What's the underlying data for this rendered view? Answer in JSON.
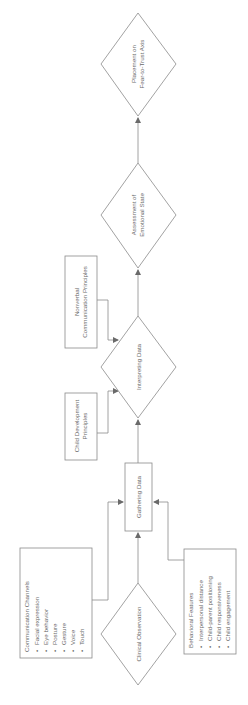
{
  "diagram": {
    "orientation": "rotated-90-ccw",
    "nodes": {
      "clinical_observation": {
        "label": "Clinical Observation",
        "shape": "diamond"
      },
      "gathering_data": {
        "label": "Gathering Data",
        "shape": "rectangle"
      },
      "interpreting_data": {
        "label": "Interpreting Data",
        "shape": "diamond"
      },
      "assessment": {
        "line1": "Assessment of",
        "line2": "Emotional State",
        "shape": "diamond"
      },
      "placement": {
        "line1": "Placement on",
        "line2": "Fear-to-Trust Axis",
        "shape": "diamond"
      },
      "child_development": {
        "line1": "Child Development",
        "line2": "Principles",
        "shape": "rectangle"
      },
      "nonverbal": {
        "line1": "Nonverbal",
        "line2": "Communication Principles",
        "shape": "rectangle"
      },
      "communication_channels": {
        "title": "Communication Channels",
        "items": [
          "Facial expression",
          "Eye behavior",
          "Posture",
          "Gesture",
          "Voice",
          "Touch"
        ]
      },
      "behavioral_features": {
        "title": "Behavioral Features",
        "items": [
          "Interpersonal distance",
          "Child-parent positioning",
          "Child responsiveness",
          "Child engagement"
        ]
      }
    },
    "bullet": "•",
    "edges": [
      {
        "from": "Clinical Observation",
        "to": "Gathering Data"
      },
      {
        "from": "Communication Channels",
        "to": "Gathering Data"
      },
      {
        "from": "Behavioral Features",
        "to": "Gathering Data"
      },
      {
        "from": "Gathering Data",
        "to": "Interpreting Data"
      },
      {
        "from": "Child Development Principles",
        "to": "Interpreting Data"
      },
      {
        "from": "Nonverbal Communication Principles",
        "to": "Interpreting Data"
      },
      {
        "from": "Interpreting Data",
        "to": "Assessment of Emotional State"
      },
      {
        "from": "Assessment of Emotional State",
        "to": "Placement on Fear-to-Trust Axis"
      }
    ],
    "colors": {
      "stroke": "#8a8a8a",
      "text": "#6a6a6a",
      "background": "#ffffff"
    }
  }
}
